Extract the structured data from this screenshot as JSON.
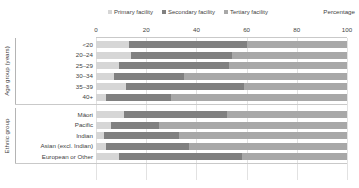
{
  "chart_data": {
    "type": "bar",
    "orientation": "horizontal",
    "stacked": true,
    "title": "",
    "subtitle": "",
    "xlabel": "Percentage",
    "ylabel": "",
    "xlim": [
      0,
      100
    ],
    "xticks": [
      0,
      20,
      40,
      60,
      80,
      100
    ],
    "grid": true,
    "legend_position": "top-center",
    "categories": [
      "<20",
      "20–24",
      "25–29",
      "30–34",
      "35–39",
      "40+",
      "Māori",
      "Pacific",
      "Indian",
      "Asian (excl. Indian)",
      "European or Other"
    ],
    "group_axis_labels": [
      "Age group (years)",
      "Ethnic group"
    ],
    "groups": [
      {
        "name": "Age group (years)",
        "categories": [
          "<20",
          "20–24",
          "25–29",
          "30–34",
          "35–39",
          "40+"
        ]
      },
      {
        "name": "Ethnic group",
        "categories": [
          "Māori",
          "Pacific",
          "Indian",
          "Asian (excl. Indian)",
          "European or Other"
        ]
      }
    ],
    "series": [
      {
        "name": "Primary facility",
        "color": "#d6d6d6",
        "values": [
          13,
          14,
          9,
          7,
          12,
          4,
          11,
          6,
          3,
          4,
          9
        ]
      },
      {
        "name": "Secondary facility",
        "color": "#808080",
        "values": [
          47,
          40,
          44,
          28,
          47,
          26,
          41,
          19,
          30,
          33,
          49
        ]
      },
      {
        "name": "Tertiary facility",
        "color": "#a8a8a8",
        "values": [
          40,
          46,
          47,
          65,
          41,
          70,
          48,
          75,
          67,
          63,
          42
        ]
      }
    ],
    "legend_entries": [
      "Primary facility",
      "Secondary facility",
      "Tertiary facility"
    ]
  }
}
